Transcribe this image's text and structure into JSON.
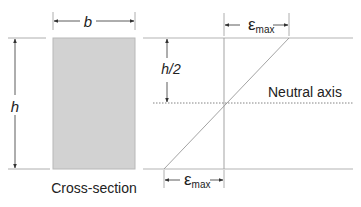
{
  "diagram": {
    "labels": {
      "width": "b",
      "height": "h",
      "half_height": "h/2",
      "strain_symbol": "ε",
      "strain_subscript": "max",
      "neutral_axis": "Neutral axis",
      "cross_section": "Cross-section"
    },
    "colors": {
      "section_fill": "#d2d2d2",
      "section_stroke": "#b0b0b0",
      "line": "#9a9a9a",
      "arrow": "#333333",
      "text": "#222222"
    }
  }
}
